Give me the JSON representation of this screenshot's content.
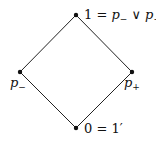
{
  "diagram": {
    "type": "hasse-diagram",
    "nodes": [
      {
        "id": "top",
        "x": 76,
        "y": 15,
        "label": {
          "lhs": "1",
          "eq": " = ",
          "a": "p",
          "a_sub": "−",
          "op": " ∨ ",
          "b": "p",
          "b_sub": "+"
        }
      },
      {
        "id": "left",
        "x": 20,
        "y": 72,
        "label": {
          "var": "p",
          "sub": "−"
        }
      },
      {
        "id": "right",
        "x": 132,
        "y": 72,
        "label": {
          "var": "p",
          "sub": "+"
        }
      },
      {
        "id": "bottom",
        "x": 76,
        "y": 128,
        "label": {
          "lhs": "0",
          "eq": " = ",
          "rhs": "1′"
        }
      }
    ],
    "edges": [
      [
        "top",
        "left"
      ],
      [
        "top",
        "right"
      ],
      [
        "left",
        "bottom"
      ],
      [
        "right",
        "bottom"
      ]
    ],
    "colors": {
      "line": "#222222",
      "node": "#111111",
      "background": "#ffffff"
    }
  }
}
